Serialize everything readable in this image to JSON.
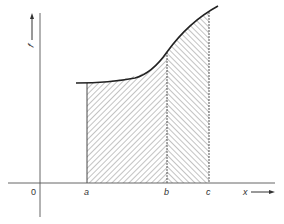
{
  "diagram": {
    "type": "area-under-curve",
    "y_axis": {
      "label": "f",
      "arrow": "up"
    },
    "x_axis": {
      "label": "x",
      "arrow": "right"
    },
    "origin_label": "0",
    "points": [
      {
        "label": "a"
      },
      {
        "label": "b"
      },
      {
        "label": "c"
      }
    ],
    "regions": [
      {
        "name": "a-to-b",
        "hatch": "backslash"
      },
      {
        "name": "b-to-c",
        "hatch": "forward-slash"
      }
    ],
    "colors": {
      "line": "#2a2a2a",
      "axis": "#555555",
      "hatch": "#666666",
      "background": "#ffffff"
    }
  }
}
